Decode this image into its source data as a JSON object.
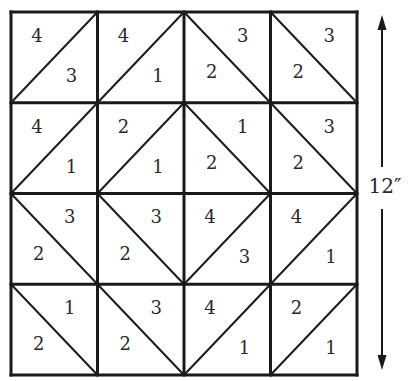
{
  "diagram": {
    "title": "",
    "grid": {
      "rows": 4,
      "cols": 4,
      "left": 11,
      "top": 12,
      "right": 357,
      "bottom": 375
    },
    "line_color": "#1a1a1a",
    "cells": [
      [
        {
          "diag": "/",
          "a": "4",
          "b": "3"
        },
        {
          "diag": "/",
          "a": "4",
          "b": "1"
        },
        {
          "diag": "\\",
          "a": "3",
          "b": "2"
        },
        {
          "diag": "\\",
          "a": "3",
          "b": "2"
        }
      ],
      [
        {
          "diag": "/",
          "a": "4",
          "b": "1"
        },
        {
          "diag": "/",
          "a": "2",
          "b": "1"
        },
        {
          "diag": "\\",
          "a": "1",
          "b": "2"
        },
        {
          "diag": "\\",
          "a": "3",
          "b": "2"
        }
      ],
      [
        {
          "diag": "\\",
          "a": "3",
          "b": "2"
        },
        {
          "diag": "\\",
          "a": "3",
          "b": "2"
        },
        {
          "diag": "/",
          "a": "4",
          "b": "3"
        },
        {
          "diag": "/",
          "a": "4",
          "b": "1"
        }
      ],
      [
        {
          "diag": "\\",
          "a": "1",
          "b": "2"
        },
        {
          "diag": "\\",
          "a": "3",
          "b": "2"
        },
        {
          "diag": "/",
          "a": "4",
          "b": "1"
        },
        {
          "diag": "/",
          "a": "2",
          "b": "1"
        }
      ]
    ],
    "dimension": {
      "label": "12″",
      "x": 382,
      "top": 15,
      "bottom": 370,
      "label_y": 195
    }
  }
}
